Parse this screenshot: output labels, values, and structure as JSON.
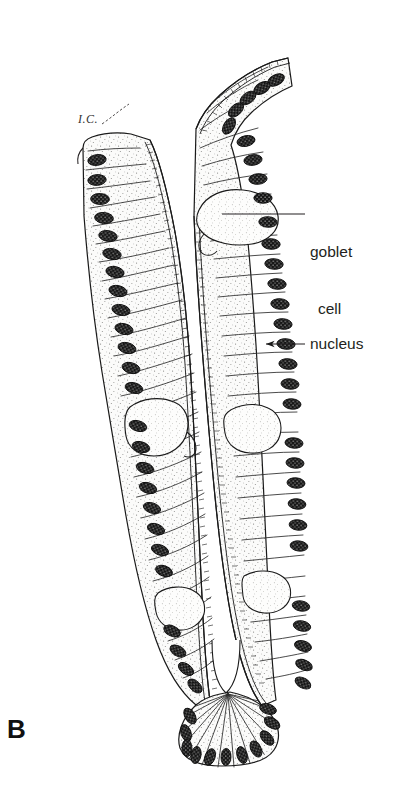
{
  "figure": {
    "panel_letter": "B",
    "background_color": "#ffffff",
    "ink_color": "#1a1a1a",
    "cytoplasm_fill": "#f7f7f5",
    "nucleus_color": "#121212",
    "label_text_color": "#231f20"
  },
  "labels": {
    "ic": "I.C.",
    "goblet_line1": "goblet",
    "goblet_line2": "cell",
    "nucleus": "nucleus"
  },
  "leaders": [
    {
      "name": "goblet-cell-leader",
      "from_x": 222,
      "from_y": 214,
      "to_x": 305,
      "to_y": 214
    },
    {
      "name": "nucleus-leader",
      "from_x": 262,
      "from_y": 344,
      "to_x": 305,
      "to_y": 344
    },
    {
      "name": "ic-leader",
      "from_x": 100,
      "from_y": 122,
      "to_x": 128,
      "to_y": 106
    }
  ]
}
